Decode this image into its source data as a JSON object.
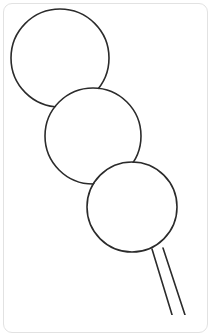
{
  "canvas": {
    "width": 215,
    "height": 315,
    "background_color": "#ffffff",
    "title": "Dango skewer line drawing"
  },
  "card": {
    "background_color": "#ffffff",
    "border_color": "#e2e2e2",
    "border_radius": 9,
    "x": 3,
    "y": 3,
    "width": 205,
    "height": 330
  },
  "artwork": {
    "name": "three-stacked-circles-on-skewer",
    "description": "Uncolored outline drawing of three overlapping circles stacked diagonally on a skewer stick",
    "stroke_color": "#2b2b2b",
    "stroke_width": 1.6,
    "fill_color": "none",
    "shapes": [
      {
        "name": "circle-top",
        "type": "circle",
        "cx": 60,
        "cy": 58,
        "r": 49,
        "order": 1
      },
      {
        "name": "circle-middle",
        "type": "circle",
        "cx": 93,
        "cy": 136,
        "r": 48,
        "order": 2
      },
      {
        "name": "circle-bottom",
        "type": "circle",
        "cx": 132,
        "cy": 207,
        "r": 45,
        "order": 3
      },
      {
        "name": "skewer-stick",
        "type": "stick",
        "top_left": [
          152,
          249
        ],
        "top_right": [
          163,
          248
        ],
        "bottom_left": [
          173,
          318
        ],
        "bottom_right": [
          186,
          318
        ],
        "order": 4
      }
    ],
    "junctions": [
      {
        "name": "junction-top-middle-left",
        "x": 53,
        "y": 100
      },
      {
        "name": "junction-top-middle-right",
        "x": 101,
        "y": 88
      },
      {
        "name": "junction-middle-bottom-left",
        "x": 82,
        "y": 172
      },
      {
        "name": "junction-middle-bottom-right",
        "x": 138,
        "y": 162
      }
    ]
  }
}
